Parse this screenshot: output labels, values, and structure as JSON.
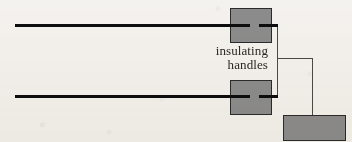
{
  "figure": {
    "background_color": "#f4f2ee",
    "annotation": {
      "name": "insulating-handles-label",
      "line_1": "insulating",
      "line_2": "handles",
      "text_color": "#2a2724",
      "font_style": "serif",
      "font_size_px": 13,
      "align": "right"
    },
    "palette": {
      "block_fill": "#8c8c8c",
      "block_stroke": "#2b2b2b",
      "rod_color": "#0d0d0d",
      "wire_color": "#4a4a4a"
    },
    "rods": [
      {
        "name": "upper-conductor-rod",
        "x1": 15,
        "y1": 25,
        "x2": 250,
        "y2": 25,
        "thickness_px": 3,
        "color": "#0d0d0d"
      },
      {
        "name": "lower-conductor-rod",
        "x1": 15,
        "y1": 96,
        "x2": 250,
        "y2": 96,
        "thickness_px": 3,
        "color": "#0d0d0d"
      }
    ],
    "blocks": [
      {
        "name": "upper-insulating-handle",
        "x": 230,
        "y": 8,
        "width": 41,
        "height": 34,
        "fill": "#8c8c8c",
        "stroke": "#2b2b2b"
      },
      {
        "name": "lower-insulating-handle",
        "x": 230,
        "y": 80,
        "width": 41,
        "height": 34,
        "fill": "#8c8c8c",
        "stroke": "#2b2b2b"
      },
      {
        "name": "electroscope-body-block",
        "x": 283,
        "y": 115,
        "width": 62,
        "height": 25,
        "fill": "#8c8c8c",
        "stroke": "#2b2b2b"
      }
    ],
    "rod_stubs": [
      {
        "name": "upper-rod-stub",
        "x1": 259,
        "y1": 25,
        "x2": 278,
        "y2": 25,
        "thickness_px": 3,
        "color": "#0d0d0d"
      },
      {
        "name": "lower-rod-stub",
        "x1": 259,
        "y1": 96,
        "x2": 278,
        "y2": 96,
        "thickness_px": 3,
        "color": "#0d0d0d"
      }
    ],
    "wires": [
      {
        "name": "vertical-connecting-wire",
        "points": "277,25 277,97",
        "thickness_px": 1,
        "color": "#4a4a4a"
      },
      {
        "name": "branch-horizontal-wire",
        "points": "277,58 312,58",
        "thickness_px": 1,
        "color": "#4a4a4a"
      },
      {
        "name": "branch-vertical-wire-to-electroscope",
        "points": "312,58 312,129",
        "thickness_px": 1,
        "color": "#4a4a4a"
      }
    ]
  }
}
